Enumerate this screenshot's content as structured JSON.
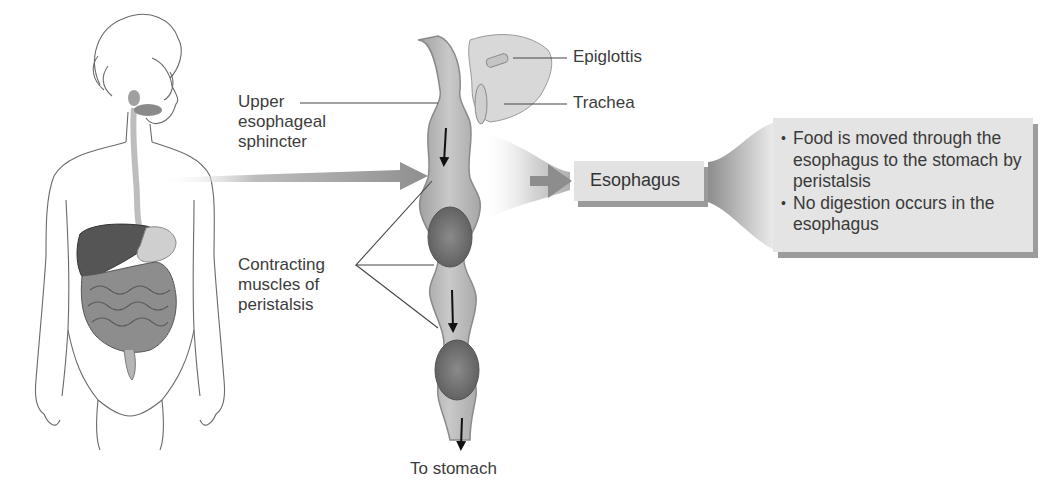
{
  "figure": {
    "labels": {
      "upper_sphincter": [
        "Upper",
        "esophageal",
        "sphincter"
      ],
      "contracting": [
        "Contracting",
        "muscles of",
        "peristalsis"
      ],
      "epiglottis": "Epiglottis",
      "trachea": "Trachea",
      "to_stomach": "To stomach",
      "organ": "Esophagus"
    },
    "info": {
      "bullets": [
        "Food is moved through the esophagus to the stomach by peristalsis",
        "No digestion occurs in the esophagus"
      ]
    },
    "colors": {
      "tube": "#b8b8b8",
      "tube_wall": "#8e8e8e",
      "bolus": "#6f6f6f",
      "arrow": "#9a9a9a",
      "box": "#e3e3e3",
      "box_shadow": "#9a9a9a"
    }
  }
}
